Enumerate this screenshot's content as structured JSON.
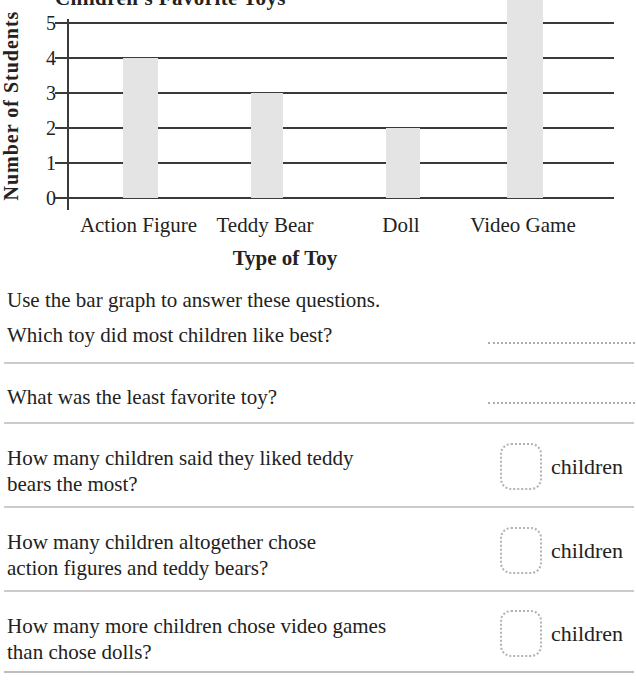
{
  "chart_data": {
    "type": "bar",
    "title": "Children's Favorite Toys",
    "categories": [
      "Action Figure",
      "Teddy Bear",
      "Doll",
      "Video Game"
    ],
    "values": [
      4,
      3,
      2,
      5
    ],
    "xlabel": "Type of Toy",
    "ylabel": "Number of Students",
    "ylim": [
      0,
      5
    ],
    "yticks": [
      0,
      1,
      2,
      3,
      4,
      5
    ],
    "grid": true,
    "legend": false,
    "bar_color": "#e4e4e4",
    "axis_color": "#3a3a3a",
    "clipping_note": "chart title and top of the Video Game bar are cut off at the top edge of the image"
  },
  "instructions": "Use the bar graph to answer these questions.",
  "questions": [
    {
      "lines": [
        "Which toy did most children like best?"
      ],
      "answer_type": "line"
    },
    {
      "lines": [
        "What was the least favorite toy?"
      ],
      "answer_type": "line"
    },
    {
      "lines": [
        "How many children said they liked teddy",
        "bears the most?"
      ],
      "answer_type": "box",
      "unit": "children"
    },
    {
      "lines": [
        "How many children altogether chose",
        "action figures and teddy bears?"
      ],
      "answer_type": "box",
      "unit": "children"
    },
    {
      "lines": [
        "How many more children chose video games",
        "than chose dolls?"
      ],
      "answer_type": "box",
      "unit": "children"
    }
  ],
  "colors": {
    "background": "#ffffff",
    "bar": "#e4e4e4",
    "grid_line": "#3a3a3a",
    "divider": "#cbcbcb",
    "dotted": "#b0b0b0",
    "text": "#222222"
  }
}
